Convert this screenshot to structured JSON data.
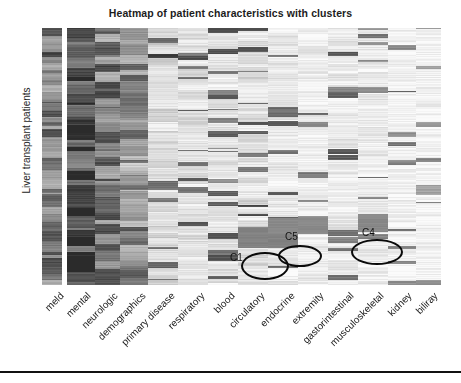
{
  "chart_data": {
    "type": "heatmap",
    "title": "Heatmap of patient characteristics with clusters",
    "xlabel": "",
    "ylabel": "Liver transplant patients",
    "grid": false,
    "legend": "none",
    "colormap": "grayscale",
    "colormap_low_hex": "#fbfbfb",
    "colormap_high_hex": "#2b2b2b",
    "n_rows": 257,
    "n_columns": 14,
    "categories": [
      "meld",
      "mental",
      "neurologic",
      "demographics",
      "primary disease",
      "respiratory",
      "blood",
      "circulatory",
      "endocrine",
      "extremity",
      "gastorintestinal",
      "musculoskeletal",
      "kidney",
      "biliray"
    ],
    "column_mean_intensity": [
      0.62,
      0.82,
      0.61,
      0.5,
      0.26,
      0.2,
      0.17,
      0.22,
      0.15,
      0.12,
      0.14,
      0.12,
      0.08,
      0.07
    ],
    "column_geometry_px": [
      {
        "name": "meld",
        "x": 0,
        "w": 20
      },
      {
        "name": "mental",
        "x": 25,
        "w": 28
      },
      {
        "name": "neurologic",
        "x": 53,
        "w": 25
      },
      {
        "name": "demographics",
        "x": 78,
        "w": 28
      },
      {
        "name": "primary disease",
        "x": 106,
        "w": 30
      },
      {
        "name": "respiratory",
        "x": 136,
        "w": 30
      },
      {
        "name": "blood",
        "x": 166,
        "w": 30
      },
      {
        "name": "circulatory",
        "x": 196,
        "w": 30
      },
      {
        "name": "endocrine",
        "x": 226,
        "w": 30
      },
      {
        "name": "extremity",
        "x": 256,
        "w": 30
      },
      {
        "name": "gastorintestinal",
        "x": 286,
        "w": 30
      },
      {
        "name": "musculoskeletal",
        "x": 316,
        "w": 30
      },
      {
        "name": "kidney",
        "x": 346,
        "w": 28
      },
      {
        "name": "biliray",
        "x": 374,
        "w": 25
      }
    ],
    "annotations": [
      {
        "label": "C1",
        "kind": "ellipse",
        "center_x_px": 223,
        "center_y_px": 238,
        "rx_px": 24,
        "ry_px": 14,
        "label_x_px": 188,
        "label_y_px": 224
      },
      {
        "label": "C5",
        "kind": "ellipse",
        "center_x_px": 258,
        "center_y_px": 228,
        "rx_px": 22,
        "ry_px": 11,
        "label_x_px": 243,
        "label_y_px": 203
      },
      {
        "label": "C4",
        "kind": "ellipse",
        "center_x_px": 335,
        "center_y_px": 224,
        "rx_px": 26,
        "ry_px": 13,
        "label_x_px": 320,
        "label_y_px": 199
      }
    ]
  },
  "xtick_geometry_px": [
    {
      "label": "meld",
      "x": 58,
      "y": 290
    },
    {
      "label": "mental",
      "x": 85,
      "y": 290
    },
    {
      "label": "neurologic",
      "x": 112,
      "y": 290
    },
    {
      "label": "demographics",
      "x": 140,
      "y": 290
    },
    {
      "label": "primary disease",
      "x": 169,
      "y": 290
    },
    {
      "label": "respiratory",
      "x": 199,
      "y": 290
    },
    {
      "label": "blood",
      "x": 229,
      "y": 290
    },
    {
      "label": "circulatory",
      "x": 259,
      "y": 290
    },
    {
      "label": "endocrine",
      "x": 289,
      "y": 290
    },
    {
      "label": "extremity",
      "x": 318,
      "y": 290
    },
    {
      "label": "gastorintestinal",
      "x": 348,
      "y": 290
    },
    {
      "label": "musculoskeletal",
      "x": 378,
      "y": 290
    },
    {
      "label": "kidney",
      "x": 406,
      "y": 290
    },
    {
      "label": "biliray",
      "x": 432,
      "y": 290
    }
  ]
}
